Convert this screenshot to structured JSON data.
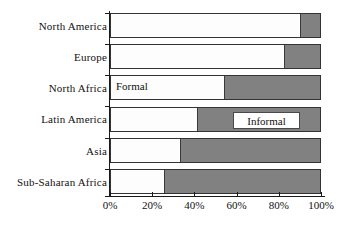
{
  "chart_data": {
    "type": "bar",
    "orientation": "horizontal",
    "stacked": true,
    "normalized": true,
    "title": "",
    "subtitle": "",
    "xlabel": "",
    "ylabel": "",
    "xlim": [
      0,
      100
    ],
    "grid": false,
    "legend_position": "in-plot-annotation",
    "categories": [
      "North America",
      "Europe",
      "North Africa",
      "Latin America",
      "Asia",
      "Sub-Saharan Africa"
    ],
    "series": [
      {
        "name": "Formal",
        "color": "#fdfdfd",
        "values": [
          90.5,
          83,
          54,
          41,
          33,
          25.5
        ]
      },
      {
        "name": "Informal",
        "color": "#818181",
        "values": [
          9.5,
          17,
          46,
          59,
          67,
          74.5
        ]
      }
    ],
    "xticks": [
      0,
      20,
      40,
      60,
      80,
      100
    ],
    "xtick_labels": [
      "0%",
      "20%",
      "40%",
      "60%",
      "80%",
      "100%"
    ],
    "annotations": [
      {
        "text": "Formal",
        "category": "North Africa",
        "placement": "inside-formal-segment"
      },
      {
        "text": "Informal",
        "category": "Latin America",
        "placement": "inside-informal-segment-boxed"
      }
    ]
  },
  "colors": {
    "formal": "#fdfdfd",
    "informal": "#818181",
    "axis": "#1a1a1a",
    "text": "#111111",
    "background": "#ffffff"
  }
}
